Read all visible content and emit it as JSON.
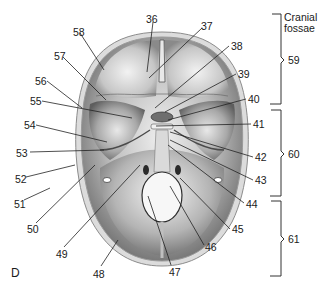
{
  "figure": {
    "panel_letter": "D",
    "colors": {
      "background": "#ffffff",
      "bone_outer": "#d8d8d8",
      "bone_inner": "#9a9a9a",
      "fossa_dark": "#6e6e6e",
      "fossa_light": "#e6e6e6",
      "leader_line": "#222222",
      "text": "#1a1a1a"
    }
  },
  "labels": [
    {
      "id": "36",
      "text": "36",
      "x": 146,
      "y": 14
    },
    {
      "id": "37",
      "text": "37",
      "x": 201,
      "y": 21
    },
    {
      "id": "38",
      "text": "38",
      "x": 231,
      "y": 41
    },
    {
      "id": "39",
      "text": "39",
      "x": 238,
      "y": 69
    },
    {
      "id": "40",
      "text": "40",
      "x": 248,
      "y": 94
    },
    {
      "id": "41",
      "text": "41",
      "x": 253,
      "y": 119
    },
    {
      "id": "42",
      "text": "42",
      "x": 255,
      "y": 152
    },
    {
      "id": "43",
      "text": "43",
      "x": 255,
      "y": 175
    },
    {
      "id": "44",
      "text": "44",
      "x": 246,
      "y": 199
    },
    {
      "id": "45",
      "text": "45",
      "x": 232,
      "y": 224
    },
    {
      "id": "46",
      "text": "46",
      "x": 205,
      "y": 242
    },
    {
      "id": "47",
      "text": "47",
      "x": 169,
      "y": 267
    },
    {
      "id": "48",
      "text": "48",
      "x": 93,
      "y": 269
    },
    {
      "id": "49",
      "text": "49",
      "x": 56,
      "y": 249
    },
    {
      "id": "50",
      "text": "50",
      "x": 27,
      "y": 224
    },
    {
      "id": "51",
      "text": "51",
      "x": 14,
      "y": 199
    },
    {
      "id": "52",
      "text": "52",
      "x": 15,
      "y": 174
    },
    {
      "id": "53",
      "text": "53",
      "x": 16,
      "y": 148
    },
    {
      "id": "54",
      "text": "54",
      "x": 24,
      "y": 120
    },
    {
      "id": "55",
      "text": "55",
      "x": 30,
      "y": 96
    },
    {
      "id": "56",
      "text": "56",
      "x": 35,
      "y": 76
    },
    {
      "id": "57",
      "text": "57",
      "x": 54,
      "y": 51
    },
    {
      "id": "58",
      "text": "58",
      "x": 73,
      "y": 27
    }
  ],
  "brackets": [
    {
      "id": "59",
      "title": "Cranial fossae",
      "title_line1": "Cranial",
      "title_line2": "fossae",
      "number": "59",
      "label": "Anterior cranial fossa region"
    },
    {
      "id": "60",
      "number": "60",
      "label": "Middle cranial fossa region"
    },
    {
      "id": "61",
      "number": "61",
      "label": "Posterior cranial fossa region"
    }
  ]
}
